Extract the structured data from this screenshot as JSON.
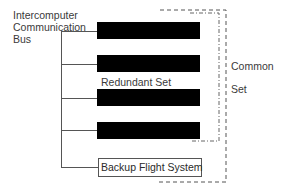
{
  "diagram": {
    "bus_label": [
      "Intercomputer",
      "Communication",
      "Bus"
    ],
    "redundant_set_label": "Redundant Set",
    "common_set_label": [
      "Common",
      "Set"
    ],
    "backup_label": "Backup Flight System",
    "computers": [
      {
        "name": "computer-1"
      },
      {
        "name": "computer-2"
      },
      {
        "name": "computer-3"
      },
      {
        "name": "computer-4"
      }
    ],
    "colors": {
      "bar": "#000000",
      "line": "#555555",
      "text": "#3a3a3a"
    }
  }
}
